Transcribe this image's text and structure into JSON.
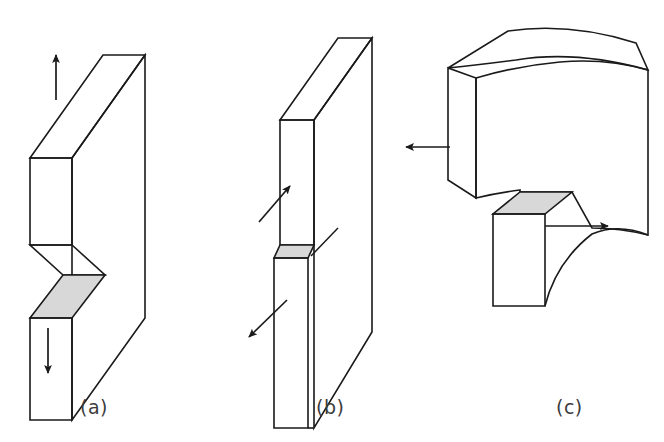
{
  "figure": {
    "type": "technical-line-diagram",
    "background_color": "#ffffff",
    "stroke_color": "#1a1a1a",
    "crack_face_fill": "#d8d8d8",
    "caption_color": "#3c3c3c",
    "width": 664,
    "height": 442
  },
  "panels": [
    {
      "id": "a",
      "caption": "(a)",
      "name": "mode-i-opening",
      "description": "Rectangular plate drawn in isometric view with a horizontal through-crack whose two faces have separated vertically; the exposed crack face is shaded light gray. One straight arrow points up from the upper half and one straight arrow points down from the lower half.",
      "arrows": [
        {
          "name": "tensile-load-up",
          "direction": "up",
          "from": [
            56,
            100
          ],
          "to": [
            56,
            52
          ]
        },
        {
          "name": "tensile-load-down",
          "direction": "down",
          "from": [
            48,
            328
          ],
          "to": [
            48,
            378
          ]
        }
      ],
      "shaded_faces": 1
    },
    {
      "id": "b",
      "caption": "(b)",
      "name": "mode-ii-sliding-shear",
      "description": "Rectangular plate in isometric view with a horizontal crack; the two halves slide past each other in the plane of the plate. A narrow shaded strip marks the crack face. Two inclined arrows point in opposite diagonal directions, up-right above the crack and down-left below it.",
      "arrows": [
        {
          "name": "shear-load-up-right",
          "direction": "up-right",
          "from": [
            259,
            222
          ],
          "to": [
            292,
            184
          ]
        },
        {
          "name": "shear-load-down-left",
          "direction": "down-left",
          "from": [
            285,
            300
          ],
          "to": [
            245,
            340
          ]
        }
      ],
      "shaded_faces": 1
    },
    {
      "id": "c",
      "caption": "(c)",
      "name": "mode-iii-tearing",
      "description": "Plate shown warped out of plane with a tab torn forward out of the body; the exposed crack surface on top of the tab is shaded light gray and a curved tear line runs down from it. One arrow points left from the upper-left block and one arrow points right from the tab.",
      "arrows": [
        {
          "name": "tearing-load-left",
          "direction": "left",
          "from": [
            447,
            147
          ],
          "to": [
            403,
            147
          ]
        },
        {
          "name": "tearing-load-right",
          "direction": "right",
          "from": [
            570,
            226
          ],
          "to": [
            612,
            226
          ]
        }
      ],
      "shaded_faces": 1
    }
  ]
}
